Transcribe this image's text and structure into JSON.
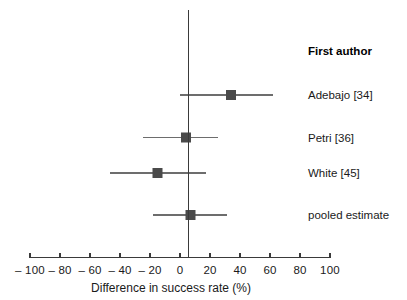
{
  "chart_data": {
    "type": "scatter",
    "subtype": "forest-plot",
    "title": "",
    "xlabel": "Difference in success rate (%)",
    "ylabel": "",
    "xlim": [
      -100,
      100
    ],
    "grid": false,
    "legend": null,
    "xticks": [
      -100,
      -80,
      -60,
      -40,
      -20,
      0,
      20,
      40,
      60,
      80,
      100
    ],
    "xticklabels": [
      "– 100",
      "– 80",
      "– 60",
      "– 40",
      "– 20",
      "0",
      "20",
      "40",
      "60",
      "80",
      "100"
    ],
    "reference_line": 0,
    "column_header": "First author",
    "marker_color": "#4a4a4a",
    "line_color": "#6d6d6d",
    "axis_color": "#3a3a3a",
    "rows": [
      {
        "label": "Adebajo [34]",
        "estimate": 34,
        "ci_low": 0,
        "ci_high": 62,
        "is_pooled": false
      },
      {
        "label": "Petri [36]",
        "estimate": 4,
        "ci_low": -25,
        "ci_high": 25,
        "is_pooled": false
      },
      {
        "label": "White [45]",
        "estimate": -15,
        "ci_low": -47,
        "ci_high": 17,
        "is_pooled": false
      },
      {
        "label": "pooled estimate",
        "estimate": 7,
        "ci_low": -18,
        "ci_high": 31,
        "is_pooled": true
      }
    ]
  }
}
